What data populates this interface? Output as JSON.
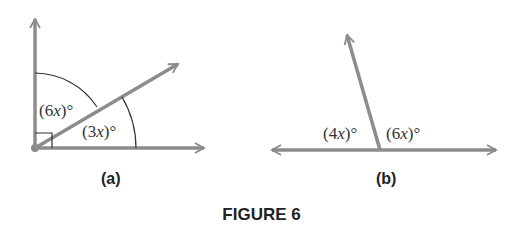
{
  "caption": "FIGURE 6",
  "panels": [
    {
      "id": "a",
      "label": "(a)",
      "description": "Right angle split by a ray into two angles",
      "angles": [
        {
          "coef": "6",
          "var": "x",
          "unit": "°",
          "text": "(6x)°"
        },
        {
          "coef": "3",
          "var": "x",
          "unit": "°",
          "text": "(3x)°"
        }
      ],
      "right_angle_marker": true
    },
    {
      "id": "b",
      "label": "(b)",
      "description": "Straight line split by a ray into two angles",
      "angles": [
        {
          "coef": "4",
          "var": "x",
          "unit": "°",
          "text": "(4x)°"
        },
        {
          "coef": "6",
          "var": "x",
          "unit": "°",
          "text": "(6x)°"
        }
      ]
    }
  ],
  "colors": {
    "ray": "#8c8c8c",
    "arc": "#333333",
    "text": "#222222"
  }
}
